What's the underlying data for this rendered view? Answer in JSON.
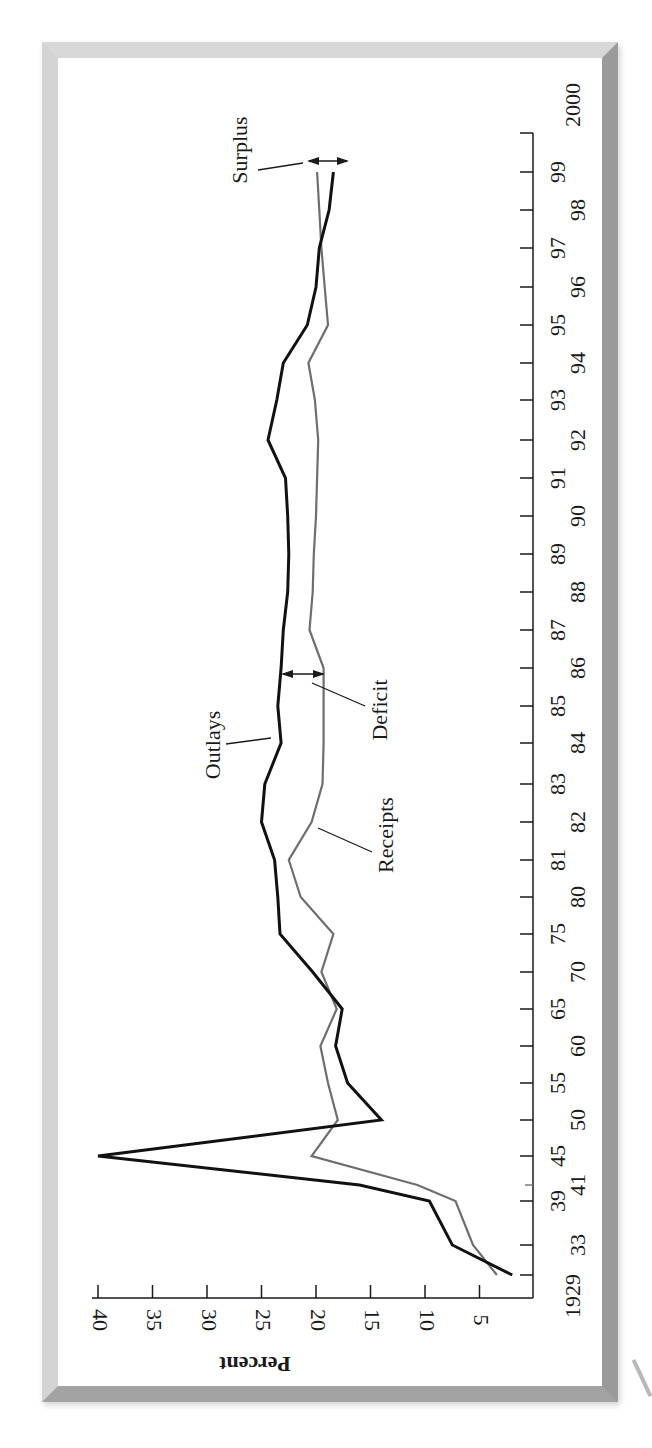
{
  "chart_data": {
    "type": "line",
    "orientation": "rotated-90-clockwise",
    "title": "",
    "xlabel": "",
    "ylabel": "Percent",
    "ylim": [
      0,
      40
    ],
    "yticks": [
      40,
      35,
      30,
      25,
      20,
      15,
      10,
      5
    ],
    "x_tick_labels": [
      "1929",
      "33",
      "39",
      "41",
      "45",
      "50",
      "55",
      "60",
      "65",
      "70",
      "75",
      "80",
      "81",
      "82",
      "83",
      "84",
      "85",
      "86",
      "87",
      "88",
      "89",
      "90",
      "91",
      "92",
      "93",
      "94",
      "95",
      "96",
      "97",
      "98",
      "99",
      "2000"
    ],
    "x": [
      1929,
      1933,
      1939,
      1941,
      1945,
      1950,
      1955,
      1960,
      1965,
      1970,
      1975,
      1980,
      1981,
      1982,
      1983,
      1984,
      1985,
      1986,
      1987,
      1988,
      1989,
      1990,
      1991,
      1992,
      1993,
      1994,
      1995,
      1996,
      1997,
      1998,
      1999
    ],
    "series": [
      {
        "name": "Outlays",
        "color": "#111111",
        "values": [
          2.0,
          7.5,
          9.6,
          16.0,
          40.0,
          14.0,
          17.1,
          18.2,
          17.6,
          20.3,
          23.3,
          23.5,
          23.8,
          25.0,
          24.7,
          23.2,
          23.5,
          23.2,
          23.0,
          22.6,
          22.5,
          22.6,
          22.8,
          24.4,
          23.6,
          23.0,
          20.8,
          20.0,
          19.7,
          18.8,
          18.4
        ]
      },
      {
        "name": "Receipts",
        "color": "#6e6e6e",
        "values": [
          3.4,
          5.6,
          7.2,
          10.7,
          20.4,
          18.0,
          18.9,
          19.6,
          18.1,
          19.5,
          18.4,
          21.4,
          22.5,
          20.4,
          19.4,
          19.3,
          19.3,
          19.3,
          20.6,
          20.3,
          20.2,
          20.0,
          19.9,
          19.8,
          20.1,
          20.7,
          18.9,
          19.2,
          19.5,
          19.7,
          19.9
        ]
      }
    ],
    "annotations": [
      {
        "text": "Outlays",
        "points_to": "Outlays line near 1984"
      },
      {
        "text": "Receipts",
        "points_to": "Receipts line near 1981-82"
      },
      {
        "text": "Deficit",
        "points_to": "gap between Outlays and Receipts at 1986 (double arrow)"
      },
      {
        "text": "Surplus",
        "points_to": "gap between Receipts and Outlays at 1999 (double arrow)"
      }
    ],
    "grid": false,
    "legend": "none (inline labels)"
  },
  "labels": {
    "ylabel": "Percent",
    "outlays": "Outlays",
    "receipts": "Receipts",
    "deficit": "Deficit",
    "surplus": "Surplus"
  }
}
